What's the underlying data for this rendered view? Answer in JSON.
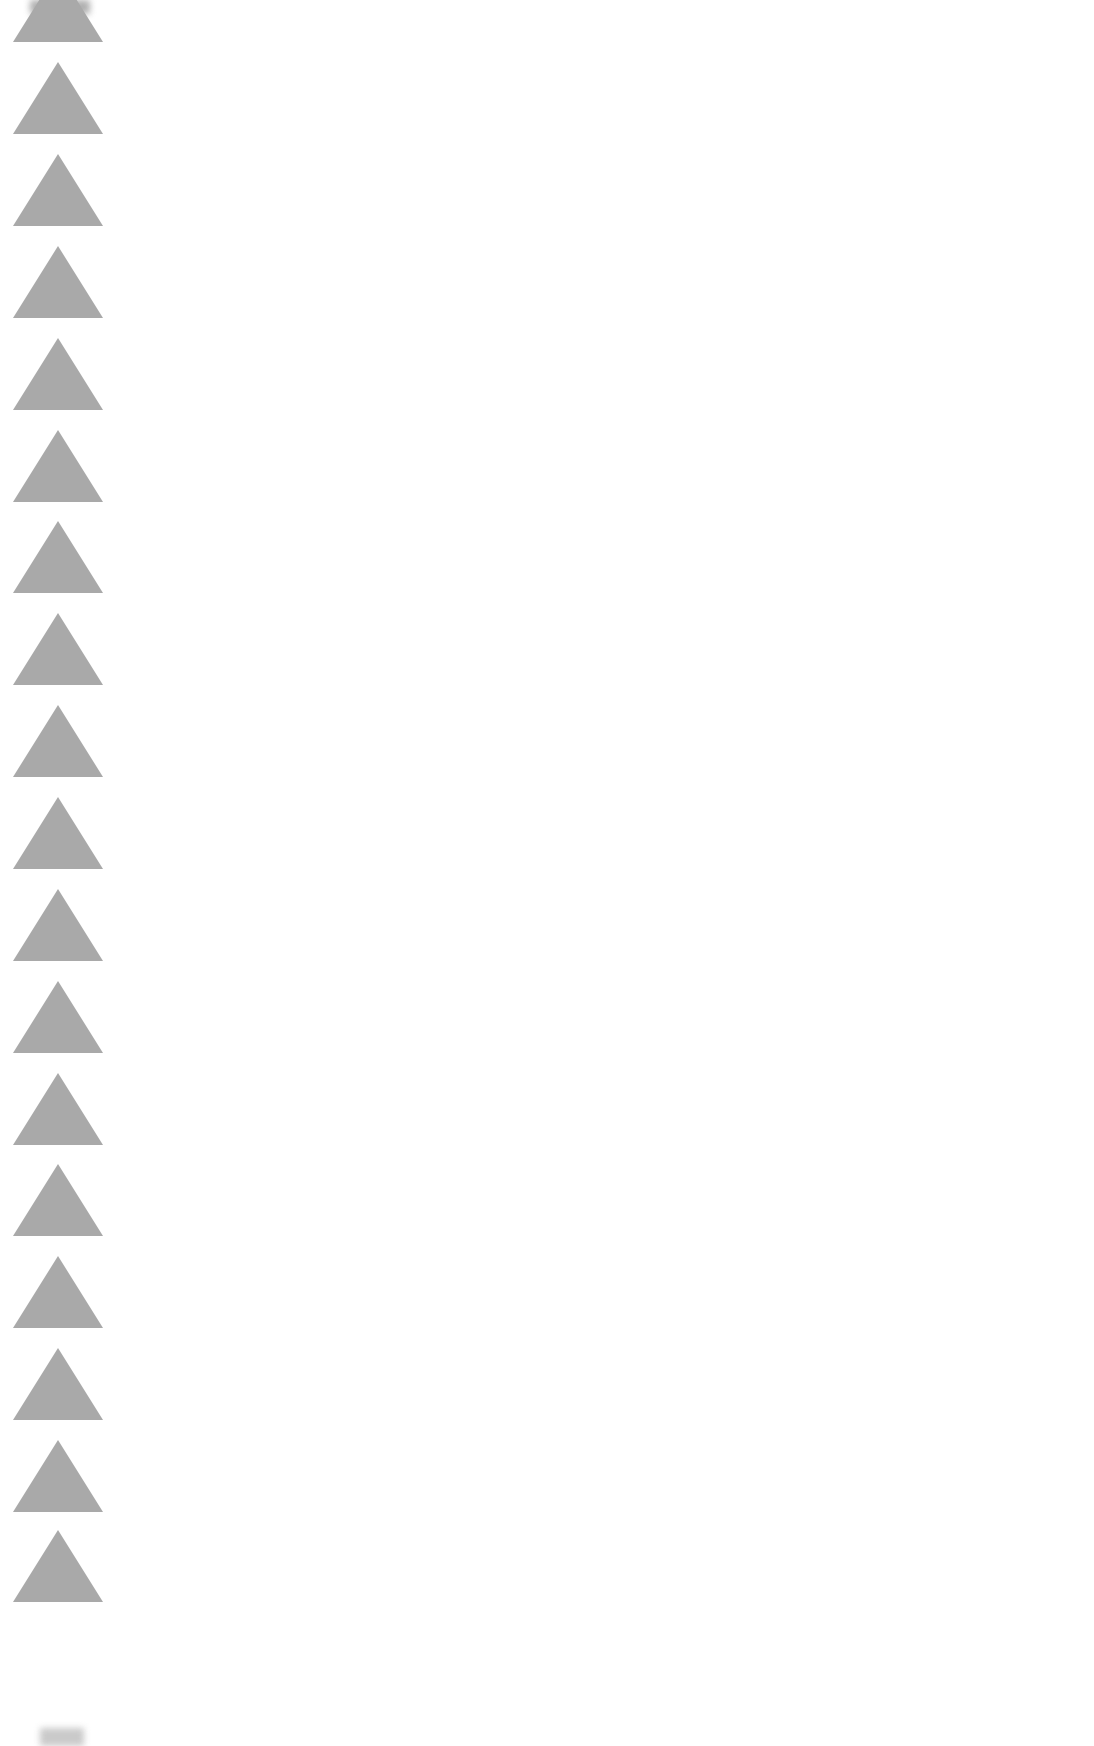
{
  "page": {
    "background_color": "#ffffff",
    "content_text": ""
  },
  "border": {
    "shape": "triangle-up",
    "color": "#a9a9a9",
    "count_visible": 19,
    "pitch_px": 92,
    "tops": [
      -30,
      62,
      154,
      246,
      338,
      430,
      521,
      613,
      705,
      797,
      889,
      981,
      1073,
      1164,
      1256,
      1348,
      1440,
      1530
    ]
  }
}
